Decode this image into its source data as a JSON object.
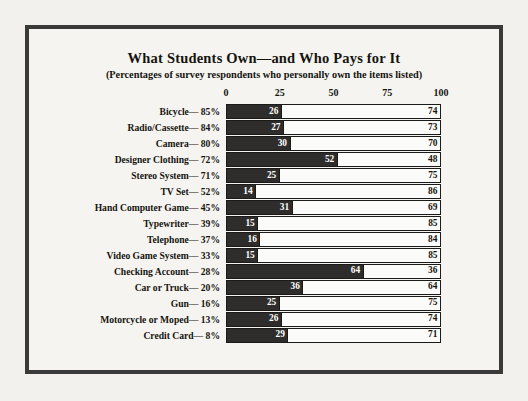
{
  "chart_data": {
    "type": "bar",
    "orientation": "horizontal",
    "stacked": true,
    "stacked_normalized": true,
    "title": "What Students Own—and Who Pays for It",
    "subtitle": "(Percentages of survey respondents who personally own the items listed)",
    "xlabel": "",
    "ylabel": "",
    "xlim": [
      0,
      100
    ],
    "xticks": [
      0,
      25,
      50,
      75,
      100
    ],
    "xtick_labels": [
      "0",
      "25",
      "50",
      "75",
      "100"
    ],
    "grid": false,
    "legend": null,
    "series": [
      {
        "name": "dark-segment",
        "color": "#2e2d2b",
        "values": [
          26,
          27,
          30,
          52,
          25,
          14,
          31,
          15,
          16,
          15,
          64,
          36,
          25,
          26,
          29
        ]
      },
      {
        "name": "light-segment",
        "color": "#fbfbf9",
        "values": [
          74,
          73,
          70,
          48,
          75,
          86,
          69,
          85,
          84,
          85,
          36,
          64,
          75,
          74,
          71
        ]
      }
    ],
    "categories": [
      "Bicycle— 85%",
      "Radio/Cassette— 84%",
      "Camera— 80%",
      "Designer Clothing— 72%",
      "Stereo System— 71%",
      "TV Set— 52%",
      "Hand Computer Game— 45%",
      "Typewriter— 39%",
      "Telephone— 37%",
      "Video Game System— 33%",
      "Checking Account— 28%",
      "Car or Truck— 20%",
      "Gun— 16%",
      "Motorcycle or Moped— 13%",
      "Credit Card— 8%"
    ],
    "rows": [
      {
        "label": "Bicycle— 85%",
        "item": "Bicycle",
        "own_pct": 85,
        "dark": 26,
        "light": 74
      },
      {
        "label": "Radio/Cassette— 84%",
        "item": "Radio/Cassette",
        "own_pct": 84,
        "dark": 27,
        "light": 73
      },
      {
        "label": "Camera— 80%",
        "item": "Camera",
        "own_pct": 80,
        "dark": 30,
        "light": 70
      },
      {
        "label": "Designer Clothing— 72%",
        "item": "Designer Clothing",
        "own_pct": 72,
        "dark": 52,
        "light": 48
      },
      {
        "label": "Stereo System— 71%",
        "item": "Stereo System",
        "own_pct": 71,
        "dark": 25,
        "light": 75
      },
      {
        "label": "TV Set— 52%",
        "item": "TV Set",
        "own_pct": 52,
        "dark": 14,
        "light": 86
      },
      {
        "label": "Hand Computer Game— 45%",
        "item": "Hand Computer Game",
        "own_pct": 45,
        "dark": 31,
        "light": 69
      },
      {
        "label": "Typewriter— 39%",
        "item": "Typewriter",
        "own_pct": 39,
        "dark": 15,
        "light": 85
      },
      {
        "label": "Telephone— 37%",
        "item": "Telephone",
        "own_pct": 37,
        "dark": 16,
        "light": 84
      },
      {
        "label": "Video Game System— 33%",
        "item": "Video Game System",
        "own_pct": 33,
        "dark": 15,
        "light": 85
      },
      {
        "label": "Checking Account— 28%",
        "item": "Checking Account",
        "own_pct": 28,
        "dark": 64,
        "light": 36
      },
      {
        "label": "Car or Truck— 20%",
        "item": "Car or Truck",
        "own_pct": 20,
        "dark": 36,
        "light": 64
      },
      {
        "label": "Gun— 16%",
        "item": "Gun",
        "own_pct": 16,
        "dark": 25,
        "light": 75
      },
      {
        "label": "Motorcycle or Moped— 13%",
        "item": "Motorcycle or Moped",
        "own_pct": 13,
        "dark": 26,
        "light": 74
      },
      {
        "label": "Credit Card—  8%",
        "item": "Credit Card",
        "own_pct": 8,
        "dark": 29,
        "light": 71
      }
    ]
  },
  "style": {
    "border_color": "#3a3a38",
    "background": "#f5f4f1",
    "dark_color": "#2e2d2b",
    "light_color": "#fbfbf9",
    "text_color": "#15140f"
  }
}
